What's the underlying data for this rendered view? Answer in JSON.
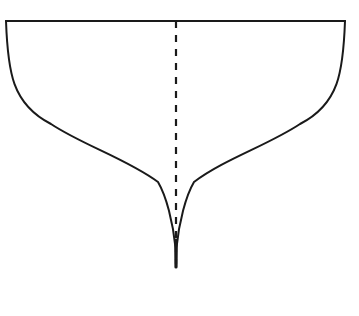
{
  "figure": {
    "name": "cusp-curve-diagram",
    "title": "",
    "background_color": "#ffffff",
    "stroke_color": "#1a1a1a",
    "canvas": {
      "width": 359,
      "height": 316
    },
    "elements": {
      "top_edge": {
        "label": "top-edge-line",
        "x1": 6,
        "y1": 21,
        "x2": 345,
        "y2": 21,
        "stroke_width": 1.8
      },
      "left_curve": {
        "label": "left-concave-curve",
        "start": [
          6,
          21
        ],
        "end": [
          176,
          267
        ],
        "control_1": [
          12,
          108
        ],
        "control_2": [
          96,
          150
        ],
        "control_3": [
          158,
          186
        ],
        "control_4": [
          173,
          222
        ],
        "stroke_width": 2.0
      },
      "right_curve": {
        "label": "right-concave-curve",
        "start": [
          345,
          21
        ],
        "end": [
          176,
          267
        ],
        "control_1": [
          339,
          108
        ],
        "control_2": [
          255,
          150
        ],
        "control_3": [
          194,
          186
        ],
        "control_4": [
          179,
          222
        ],
        "stroke_width": 2.0
      },
      "axis_dashed": {
        "label": "vertical-axis-of-symmetry",
        "x": 176,
        "y1": 21,
        "y2": 267,
        "stroke_width": 2.2,
        "dash": "7 7"
      },
      "cusp_tip": {
        "label": "cusp-point",
        "x": 176,
        "y": 267
      }
    }
  },
  "chart_data": {
    "type": "line",
    "title": "",
    "xlabel": "",
    "ylabel": "",
    "grid": false,
    "legend": null,
    "xlim": [
      0,
      359
    ],
    "ylim": [
      0,
      316
    ],
    "annotations": [],
    "series": [
      {
        "name": "top-edge",
        "style": "solid",
        "x": [
          6,
          345
        ],
        "y": [
          21,
          21
        ]
      },
      {
        "name": "left-branch",
        "style": "solid",
        "x": [
          6,
          12,
          22,
          38,
          62,
          92,
          124,
          150,
          166,
          173,
          176,
          176
        ],
        "y": [
          21,
          60,
          90,
          115,
          135,
          152,
          167,
          182,
          202,
          226,
          248,
          267
        ]
      },
      {
        "name": "right-branch",
        "style": "solid",
        "x": [
          345,
          339,
          329,
          313,
          289,
          259,
          227,
          201,
          185,
          179,
          176,
          176
        ],
        "y": [
          21,
          60,
          90,
          115,
          135,
          152,
          167,
          182,
          202,
          226,
          248,
          267
        ]
      },
      {
        "name": "axis-of-symmetry",
        "style": "dashed",
        "x": [
          176,
          176
        ],
        "y": [
          21,
          267
        ]
      }
    ]
  }
}
